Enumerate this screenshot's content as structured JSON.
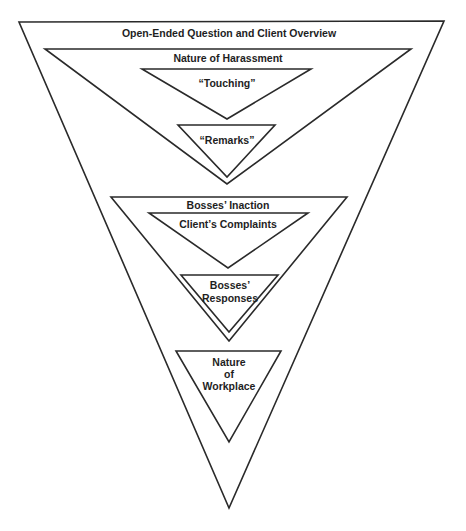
{
  "diagram": {
    "levels": [
      {
        "id": "overview",
        "label": "Open-Ended Question and Client Overview",
        "points": "19,22 444,21 229,508",
        "label_x": 229,
        "label_y": 37
      },
      {
        "id": "harassment",
        "label": "Nature of Harassment",
        "points": "45,49 411,49 227,184",
        "label_x": 228,
        "label_y": 62
      },
      {
        "id": "touching",
        "label": "“Touching”",
        "points": "142,69 311,69 227,119",
        "label_x": 227,
        "label_y": 87
      },
      {
        "id": "remarks",
        "label": "“Remarks”",
        "points": "178,125 275,125 227,177",
        "label_x": 227,
        "label_y": 144
      },
      {
        "id": "inaction",
        "label": "Bosses’ Inaction",
        "points": "111,197 347,197 229,341",
        "label_x": 228,
        "label_y": 209
      },
      {
        "id": "complaints",
        "label": "Client’s Complaints",
        "points": "149,213 308,213 228,268",
        "label_x": 228,
        "label_y": 228
      },
      {
        "id": "responses",
        "label_lines": [
          "Bosses’",
          "Responses"
        ],
        "points": "181,275 278,275 229,332",
        "label_x": 230,
        "label_y": 288
      },
      {
        "id": "workplace",
        "label_lines": [
          "Nature",
          "of",
          "Workplace"
        ],
        "points": "176,351 281,351 229,442",
        "label_x": 229,
        "label_y": 365
      }
    ],
    "stroke_color": "#2a2a2a",
    "text_color": "#1e1e1e"
  }
}
